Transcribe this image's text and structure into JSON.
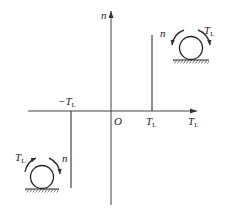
{
  "diagram": {
    "type": "motor-load-torque-speed-quadrant",
    "axes": {
      "vertical_label": "n",
      "horizontal_label": "T",
      "horizontal_label_sub": "L",
      "origin_label": "O"
    },
    "ticks": [
      {
        "label": "T",
        "sub": "L",
        "sign": "+"
      },
      {
        "label": "−T",
        "sub": "L",
        "sign": "-"
      }
    ],
    "characteristics": [
      {
        "quadrant": "I",
        "line": "vertical at +T_L, n > 0"
      },
      {
        "quadrant": "III",
        "line": "vertical at -T_L, n < 0"
      }
    ],
    "motors": [
      {
        "position": "upper-right",
        "n_label": "n",
        "t_label": "T",
        "t_sub": "L",
        "n_direction": "counter-clockwise",
        "t_direction": "clockwise"
      },
      {
        "position": "lower-left",
        "n_label": "n",
        "t_label": "T",
        "t_sub": "L",
        "n_direction": "clockwise",
        "t_direction": "counter-clockwise"
      }
    ],
    "colors": {
      "line": "#333333",
      "background": "#ffffff"
    }
  }
}
